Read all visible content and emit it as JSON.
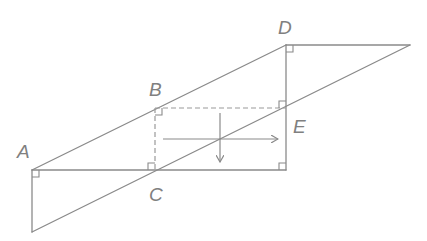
{
  "diagram": {
    "type": "geometry-figure",
    "colors": {
      "line": "#8a8a8a",
      "dashed": "#9a9a9a",
      "label": "#808080",
      "background": "#ffffff"
    },
    "points": {
      "A": {
        "label": "A",
        "x": 32,
        "y": 170
      },
      "B": {
        "label": "B",
        "x": 155,
        "y": 108
      },
      "C": {
        "label": "C",
        "x": 155,
        "y": 170
      },
      "D": {
        "label": "D",
        "x": 286,
        "y": 45
      },
      "E": {
        "label": "E",
        "x": 286,
        "y": 108
      }
    },
    "labels": {
      "A": "A",
      "B": "B",
      "C": "C",
      "D": "D",
      "E": "E"
    },
    "segments": [
      {
        "from": "A",
        "to": "D",
        "style": "solid"
      },
      {
        "from": "A",
        "to": "(286,170)",
        "style": "solid"
      },
      {
        "from": "D",
        "to": "(286,170)",
        "style": "solid"
      },
      {
        "from": "D",
        "to": "(410,45)",
        "style": "solid"
      },
      {
        "from": "A",
        "to": "(32,232)",
        "style": "solid"
      },
      {
        "from": "(32,232)",
        "to": "(410,45)",
        "style": "solid"
      },
      {
        "from": "B",
        "to": "E",
        "style": "dashed"
      },
      {
        "from": "B",
        "to": "C",
        "style": "dashed"
      }
    ],
    "right_angle_marks": [
      "A",
      "B",
      "C",
      "D",
      "E",
      "bottom-right corner (286,170)"
    ],
    "arrows": [
      {
        "direction": "right",
        "from": [
          163,
          139
        ],
        "to": [
          278,
          139
        ]
      },
      {
        "direction": "down",
        "from": [
          220,
          113
        ],
        "to": [
          220,
          162
        ]
      }
    ]
  }
}
